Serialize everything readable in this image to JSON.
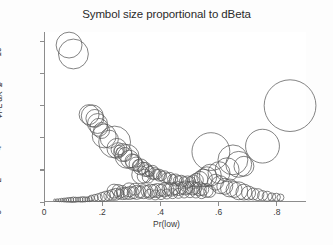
{
  "chart_data": {
    "type": "scatter",
    "title": "Symbol size proportional to dBeta",
    "xlabel": "Pr(low)",
    "ylabel": "H-L dX^2",
    "xlim": [
      0,
      0.9
    ],
    "ylim": [
      0,
      10.6
    ],
    "xticks": [
      0,
      0.2,
      0.4,
      0.6,
      0.8
    ],
    "xtick_labels": [
      "0",
      ".2",
      ".4",
      ".6",
      ".8"
    ],
    "yticks": [
      0,
      2,
      4,
      6,
      8,
      10
    ],
    "ytick_labels": [
      "0",
      "2",
      "4",
      "6",
      "8",
      "10"
    ],
    "grid": false,
    "legend": "none",
    "size_encoding": "symbol size proportional to dBeta",
    "marker": "open-circle",
    "marker_color": "#585858",
    "points": [
      {
        "x": 0.083,
        "y": 9.78,
        "r": 13
      },
      {
        "x": 0.098,
        "y": 9.22,
        "r": 15
      },
      {
        "x": 0.845,
        "y": 5.98,
        "r": 26
      },
      {
        "x": 0.152,
        "y": 5.42,
        "r": 10
      },
      {
        "x": 0.163,
        "y": 5.34,
        "r": 11
      },
      {
        "x": 0.172,
        "y": 5.18,
        "r": 9
      },
      {
        "x": 0.181,
        "y": 4.86,
        "r": 10
      },
      {
        "x": 0.186,
        "y": 4.62,
        "r": 9
      },
      {
        "x": 0.195,
        "y": 4.42,
        "r": 8
      },
      {
        "x": 0.204,
        "y": 4.08,
        "r": 12
      },
      {
        "x": 0.222,
        "y": 3.88,
        "r": 9
      },
      {
        "x": 0.24,
        "y": 3.7,
        "r": 16
      },
      {
        "x": 0.248,
        "y": 3.3,
        "r": 10
      },
      {
        "x": 0.252,
        "y": 3.22,
        "r": 7
      },
      {
        "x": 0.255,
        "y": 3.18,
        "r": 5
      },
      {
        "x": 0.258,
        "y": 3.12,
        "r": 3.5
      },
      {
        "x": 0.268,
        "y": 3.04,
        "r": 9
      },
      {
        "x": 0.276,
        "y": 2.92,
        "r": 7
      },
      {
        "x": 0.283,
        "y": 2.8,
        "r": 12
      },
      {
        "x": 0.292,
        "y": 2.62,
        "r": 9
      },
      {
        "x": 0.3,
        "y": 2.52,
        "r": 7
      },
      {
        "x": 0.306,
        "y": 2.42,
        "r": 8
      },
      {
        "x": 0.314,
        "y": 2.32,
        "r": 7
      },
      {
        "x": 0.322,
        "y": 2.22,
        "r": 6
      },
      {
        "x": 0.33,
        "y": 2.14,
        "r": 8
      },
      {
        "x": 0.338,
        "y": 2.06,
        "r": 6
      },
      {
        "x": 0.346,
        "y": 1.98,
        "r": 7
      },
      {
        "x": 0.354,
        "y": 1.9,
        "r": 6
      },
      {
        "x": 0.362,
        "y": 1.86,
        "r": 5
      },
      {
        "x": 0.37,
        "y": 1.8,
        "r": 7
      },
      {
        "x": 0.33,
        "y": 1.64,
        "r": 9
      },
      {
        "x": 0.342,
        "y": 1.56,
        "r": 7
      },
      {
        "x": 0.356,
        "y": 1.5,
        "r": 6
      },
      {
        "x": 0.378,
        "y": 1.72,
        "r": 6
      },
      {
        "x": 0.386,
        "y": 1.68,
        "r": 5
      },
      {
        "x": 0.394,
        "y": 1.62,
        "r": 6
      },
      {
        "x": 0.402,
        "y": 1.58,
        "r": 5
      },
      {
        "x": 0.412,
        "y": 1.52,
        "r": 6
      },
      {
        "x": 0.42,
        "y": 1.46,
        "r": 5
      },
      {
        "x": 0.43,
        "y": 1.42,
        "r": 6
      },
      {
        "x": 0.44,
        "y": 1.36,
        "r": 5
      },
      {
        "x": 0.45,
        "y": 1.32,
        "r": 6
      },
      {
        "x": 0.46,
        "y": 1.28,
        "r": 5
      },
      {
        "x": 0.47,
        "y": 1.24,
        "r": 6
      },
      {
        "x": 0.48,
        "y": 1.22,
        "r": 5
      },
      {
        "x": 0.492,
        "y": 1.2,
        "r": 6
      },
      {
        "x": 0.502,
        "y": 1.22,
        "r": 5
      },
      {
        "x": 0.512,
        "y": 1.26,
        "r": 6
      },
      {
        "x": 0.522,
        "y": 1.3,
        "r": 7
      },
      {
        "x": 0.534,
        "y": 1.36,
        "r": 8
      },
      {
        "x": 0.546,
        "y": 1.44,
        "r": 9
      },
      {
        "x": 0.558,
        "y": 1.52,
        "r": 10
      },
      {
        "x": 0.57,
        "y": 1.62,
        "r": 11
      },
      {
        "x": 0.572,
        "y": 3.1,
        "r": 19
      },
      {
        "x": 0.648,
        "y": 2.58,
        "r": 15
      },
      {
        "x": 0.668,
        "y": 2.3,
        "r": 13
      },
      {
        "x": 0.686,
        "y": 2.18,
        "r": 10
      },
      {
        "x": 0.628,
        "y": 1.96,
        "r": 12
      },
      {
        "x": 0.6,
        "y": 1.78,
        "r": 11
      },
      {
        "x": 0.75,
        "y": 3.44,
        "r": 17
      },
      {
        "x": 0.588,
        "y": 1.18,
        "r": 8
      },
      {
        "x": 0.604,
        "y": 1.02,
        "r": 9
      },
      {
        "x": 0.62,
        "y": 0.92,
        "r": 8
      },
      {
        "x": 0.636,
        "y": 0.82,
        "r": 9
      },
      {
        "x": 0.652,
        "y": 0.72,
        "r": 8
      },
      {
        "x": 0.668,
        "y": 0.64,
        "r": 9
      },
      {
        "x": 0.686,
        "y": 0.56,
        "r": 8
      },
      {
        "x": 0.702,
        "y": 0.5,
        "r": 7
      },
      {
        "x": 0.718,
        "y": 0.44,
        "r": 6
      },
      {
        "x": 0.734,
        "y": 0.4,
        "r": 6
      },
      {
        "x": 0.75,
        "y": 0.34,
        "r": 5
      },
      {
        "x": 0.766,
        "y": 0.3,
        "r": 5
      },
      {
        "x": 0.782,
        "y": 0.26,
        "r": 4
      },
      {
        "x": 0.798,
        "y": 0.24,
        "r": 4
      },
      {
        "x": 0.812,
        "y": 0.22,
        "r": 3.5
      },
      {
        "x": 0.16,
        "y": 0.18,
        "r": 3
      },
      {
        "x": 0.172,
        "y": 0.2,
        "r": 3.5
      },
      {
        "x": 0.184,
        "y": 0.22,
        "r": 4
      },
      {
        "x": 0.196,
        "y": 0.26,
        "r": 4.5
      },
      {
        "x": 0.208,
        "y": 0.3,
        "r": 5
      },
      {
        "x": 0.22,
        "y": 0.34,
        "r": 5
      },
      {
        "x": 0.232,
        "y": 0.38,
        "r": 5.5
      },
      {
        "x": 0.244,
        "y": 0.42,
        "r": 6
      },
      {
        "x": 0.256,
        "y": 0.44,
        "r": 5
      },
      {
        "x": 0.268,
        "y": 0.46,
        "r": 6
      },
      {
        "x": 0.28,
        "y": 0.48,
        "r": 6
      },
      {
        "x": 0.292,
        "y": 0.5,
        "r": 6.5
      },
      {
        "x": 0.304,
        "y": 0.52,
        "r": 6
      },
      {
        "x": 0.316,
        "y": 0.54,
        "r": 7
      },
      {
        "x": 0.328,
        "y": 0.56,
        "r": 6
      },
      {
        "x": 0.34,
        "y": 0.58,
        "r": 7
      },
      {
        "x": 0.352,
        "y": 0.6,
        "r": 6
      },
      {
        "x": 0.364,
        "y": 0.62,
        "r": 7
      },
      {
        "x": 0.376,
        "y": 0.64,
        "r": 6.5
      },
      {
        "x": 0.388,
        "y": 0.66,
        "r": 7
      },
      {
        "x": 0.4,
        "y": 0.68,
        "r": 6
      },
      {
        "x": 0.412,
        "y": 0.7,
        "r": 7
      },
      {
        "x": 0.424,
        "y": 0.72,
        "r": 6
      },
      {
        "x": 0.436,
        "y": 0.74,
        "r": 7
      },
      {
        "x": 0.448,
        "y": 0.76,
        "r": 6
      },
      {
        "x": 0.46,
        "y": 0.78,
        "r": 7
      },
      {
        "x": 0.472,
        "y": 0.8,
        "r": 6
      },
      {
        "x": 0.484,
        "y": 0.82,
        "r": 7
      },
      {
        "x": 0.496,
        "y": 0.84,
        "r": 6
      },
      {
        "x": 0.508,
        "y": 0.82,
        "r": 7
      },
      {
        "x": 0.52,
        "y": 0.8,
        "r": 6
      },
      {
        "x": 0.532,
        "y": 0.76,
        "r": 7
      },
      {
        "x": 0.544,
        "y": 0.72,
        "r": 6
      },
      {
        "x": 0.556,
        "y": 0.66,
        "r": 7
      },
      {
        "x": 0.568,
        "y": 0.6,
        "r": 6
      },
      {
        "x": 0.238,
        "y": 0.62,
        "r": 7
      },
      {
        "x": 0.252,
        "y": 0.66,
        "r": 6
      },
      {
        "x": 0.266,
        "y": 0.6,
        "r": 6
      },
      {
        "x": 0.29,
        "y": 0.7,
        "r": 7
      },
      {
        "x": 0.31,
        "y": 0.74,
        "r": 6
      },
      {
        "x": 0.36,
        "y": 0.42,
        "r": 5
      },
      {
        "x": 0.38,
        "y": 0.38,
        "r": 5
      },
      {
        "x": 0.4,
        "y": 0.4,
        "r": 5
      },
      {
        "x": 0.42,
        "y": 0.44,
        "r": 5
      },
      {
        "x": 0.44,
        "y": 0.46,
        "r": 5
      },
      {
        "x": 0.46,
        "y": 0.48,
        "r": 5
      },
      {
        "x": 0.48,
        "y": 0.5,
        "r": 5
      },
      {
        "x": 0.5,
        "y": 0.52,
        "r": 5
      },
      {
        "x": 0.52,
        "y": 0.5,
        "r": 5
      },
      {
        "x": 0.54,
        "y": 0.46,
        "r": 5
      },
      {
        "x": 0.034,
        "y": 0.05,
        "r": 1.2
      },
      {
        "x": 0.042,
        "y": 0.05,
        "r": 1.4
      },
      {
        "x": 0.05,
        "y": 0.05,
        "r": 1.6
      },
      {
        "x": 0.058,
        "y": 0.06,
        "r": 1.8
      },
      {
        "x": 0.066,
        "y": 0.06,
        "r": 2.0
      },
      {
        "x": 0.074,
        "y": 0.06,
        "r": 2.2
      },
      {
        "x": 0.082,
        "y": 0.07,
        "r": 2.4
      },
      {
        "x": 0.09,
        "y": 0.07,
        "r": 2.6
      },
      {
        "x": 0.098,
        "y": 0.08,
        "r": 2.8
      },
      {
        "x": 0.106,
        "y": 0.08,
        "r": 2.6
      },
      {
        "x": 0.114,
        "y": 0.09,
        "r": 2.4
      },
      {
        "x": 0.122,
        "y": 0.09,
        "r": 2.6
      },
      {
        "x": 0.13,
        "y": 0.1,
        "r": 2.8
      },
      {
        "x": 0.138,
        "y": 0.1,
        "r": 2.6
      },
      {
        "x": 0.146,
        "y": 0.11,
        "r": 2.4
      },
      {
        "x": 0.154,
        "y": 0.12,
        "r": 2.6
      }
    ]
  }
}
